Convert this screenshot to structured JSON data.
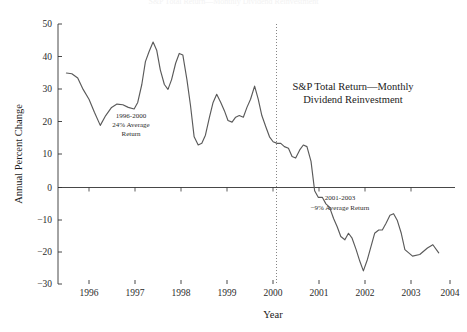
{
  "figure": {
    "background_color": "#ffffff",
    "line_color": "#5a5a5a",
    "axis_color": "#333333",
    "divider_color": "#777777",
    "clipped_title": "S&P Total Return—Monthly Dividend Reinvestment"
  },
  "axes": {
    "x_title": "Year",
    "y_title": "Annual Percent Change",
    "x_ticks": [
      "1996",
      "1997",
      "1998",
      "1999",
      "2000",
      "2001",
      "2002",
      "2003",
      "2004"
    ],
    "y_ticks": [
      "50",
      "40",
      "30",
      "20",
      "10",
      "0",
      "−10",
      "−20",
      "−30"
    ]
  },
  "annotations": {
    "legend": {
      "line1": "S&P Total Return—Monthly",
      "line2": "Dividend Reinvestment"
    },
    "left_note": {
      "line1": "1996-2000",
      "line2": "24% Average",
      "line3": "Return"
    },
    "right_note": {
      "line1": "2001-2003",
      "line2": "−9% Average Return"
    }
  },
  "chart_data": {
    "type": "line",
    "title": "S&P Total Return—Monthly Dividend Reinvestment",
    "xlabel": "Year",
    "ylabel": "Annual Percent Change",
    "xlim": [
      1995.5,
      2004.2
    ],
    "ylim": [
      -30,
      50
    ],
    "grid": false,
    "legend_position": "inside-upper-right",
    "zero_line": 0,
    "divider_x": 2000.5,
    "series": [
      {
        "name": "S&P Total Return (annual percent change, monthly)",
        "x": [
          1995.5,
          1995.62,
          1995.75,
          1995.87,
          1996.0,
          1996.12,
          1996.25,
          1996.37,
          1996.5,
          1996.62,
          1996.75,
          1996.87,
          1997.0,
          1997.08,
          1997.17,
          1997.25,
          1997.33,
          1997.42,
          1997.5,
          1997.58,
          1997.67,
          1997.75,
          1997.83,
          1997.92,
          1998.0,
          1998.08,
          1998.17,
          1998.25,
          1998.33,
          1998.42,
          1998.5,
          1998.58,
          1998.67,
          1998.75,
          1998.83,
          1998.92,
          1999.0,
          1999.08,
          1999.17,
          1999.25,
          1999.33,
          1999.42,
          1999.5,
          1999.58,
          1999.67,
          1999.75,
          1999.83,
          1999.92,
          2000.0,
          2000.08,
          2000.17,
          2000.25,
          2000.33,
          2000.42,
          2000.5,
          2000.58,
          2000.67,
          2000.75,
          2000.83,
          2000.92,
          2001.0,
          2001.08,
          2001.17,
          2001.25,
          2001.33,
          2001.42,
          2001.5,
          2001.58,
          2001.67,
          2001.75,
          2001.83,
          2001.92,
          2002.0,
          2002.08,
          2002.17,
          2002.25,
          2002.33,
          2002.42,
          2002.5,
          2002.58,
          2002.67,
          2002.75,
          2002.83,
          2002.92,
          2003.0,
          2003.17,
          2003.33,
          2003.5,
          2003.62,
          2003.75
        ],
        "y": [
          35.0,
          34.8,
          33.5,
          30.0,
          27.0,
          23.0,
          19.0,
          22.0,
          24.5,
          25.5,
          25.3,
          24.5,
          24.0,
          26.0,
          31.5,
          38.5,
          41.5,
          44.5,
          42.0,
          36.0,
          31.5,
          30.0,
          33.0,
          38.0,
          41.0,
          40.5,
          33.0,
          25.0,
          15.5,
          13.0,
          13.5,
          16.0,
          21.5,
          26.0,
          28.5,
          26.0,
          23.5,
          20.5,
          20.0,
          21.5,
          22.0,
          21.5,
          24.5,
          27.0,
          31.0,
          27.0,
          22.0,
          18.5,
          15.5,
          14.0,
          13.5,
          13.5,
          12.5,
          12.0,
          9.5,
          9.0,
          11.5,
          13.0,
          12.5,
          8.0,
          -1.0,
          -3.0,
          -3.0,
          -5.0,
          -6.0,
          -9.5,
          -12.0,
          -15.0,
          -16.0,
          -14.0,
          -15.5,
          -19.0,
          -22.5,
          -25.5,
          -22.0,
          -18.0,
          -14.0,
          -13.0,
          -13.0,
          -11.0,
          -8.5,
          -8.0,
          -10.0,
          -14.0,
          -19.0,
          -21.0,
          -20.5,
          -18.5,
          -17.5,
          -20.0
        ]
      }
    ],
    "segment_averages": [
      {
        "label": "1996-2000",
        "value": 24,
        "note": "24% Average Return"
      },
      {
        "label": "2001-2003",
        "value": -9,
        "note": "−9% Average Return"
      }
    ]
  }
}
